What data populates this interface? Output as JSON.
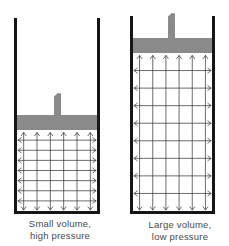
{
  "figure": {
    "background": "#ffffff",
    "colors": {
      "wall": "#161616",
      "piston": "#8a8a8a",
      "arrow": "#3c3c3c",
      "label": "#4a4a4a"
    },
    "containers": [
      {
        "name": "small-volume-cylinder",
        "label": [
          "Small volume,",
          "high pressure"
        ],
        "geometry": {
          "x": 14,
          "top": 18,
          "bottom": 214,
          "width": 86,
          "wall": 3
        },
        "piston": {
          "top": 115,
          "height": 15
        },
        "handle": {
          "x": 54,
          "width": 7,
          "top": 93
        },
        "arrows": {
          "vertical": 6,
          "horizontal": 7
        }
      },
      {
        "name": "large-volume-cylinder",
        "label": [
          "Large volume,",
          "low pressure"
        ],
        "geometry": {
          "x": 130,
          "top": 16,
          "bottom": 214,
          "width": 85,
          "wall": 3
        },
        "piston": {
          "top": 38,
          "height": 15
        },
        "handle": {
          "x": 168,
          "width": 7,
          "top": 13
        },
        "arrows": {
          "vertical": 6,
          "horizontal": 8
        }
      }
    ]
  }
}
